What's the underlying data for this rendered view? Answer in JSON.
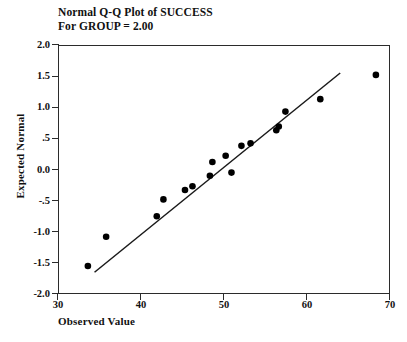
{
  "chart_data": {
    "type": "scatter",
    "title": "Normal Q-Q Plot of SUCCESS",
    "subtitle": "For GROUP = 2.00",
    "xlabel": "Observed Value",
    "ylabel": "Expected Normal",
    "xlim": [
      30,
      70
    ],
    "ylim": [
      -2.0,
      2.0
    ],
    "xticks": [
      30,
      40,
      50,
      60,
      70
    ],
    "xtick_labels": [
      "30",
      "40",
      "50",
      "60",
      "70"
    ],
    "yticks": [
      2.0,
      1.5,
      1.0,
      0.5,
      0.0,
      -0.5,
      -1.0,
      -1.5,
      -2.0
    ],
    "ytick_labels": [
      "2.0",
      "1.5",
      "1.0",
      ".5",
      "0.0",
      "-.5",
      "-1.0",
      "-1.5",
      "-2.0"
    ],
    "grid": false,
    "legend": false,
    "marker_color": "#000000",
    "line_color": "#1a1a1a",
    "frame_color": "#2b2b2b",
    "points": [
      {
        "x": 33.6,
        "y": -1.55
      },
      {
        "x": 35.8,
        "y": -1.08
      },
      {
        "x": 41.9,
        "y": -0.75
      },
      {
        "x": 42.7,
        "y": -0.48
      },
      {
        "x": 45.3,
        "y": -0.33
      },
      {
        "x": 46.2,
        "y": -0.27
      },
      {
        "x": 48.3,
        "y": -0.1
      },
      {
        "x": 48.6,
        "y": 0.12
      },
      {
        "x": 50.2,
        "y": 0.22
      },
      {
        "x": 50.9,
        "y": -0.05
      },
      {
        "x": 52.1,
        "y": 0.38
      },
      {
        "x": 53.2,
        "y": 0.42
      },
      {
        "x": 56.3,
        "y": 0.63
      },
      {
        "x": 56.6,
        "y": 0.69
      },
      {
        "x": 57.4,
        "y": 0.93
      },
      {
        "x": 61.6,
        "y": 1.13
      },
      {
        "x": 68.3,
        "y": 1.52
      }
    ],
    "reference_line": {
      "x1": 34.4,
      "y1": -1.65,
      "x2": 64.0,
      "y2": 1.55
    }
  }
}
